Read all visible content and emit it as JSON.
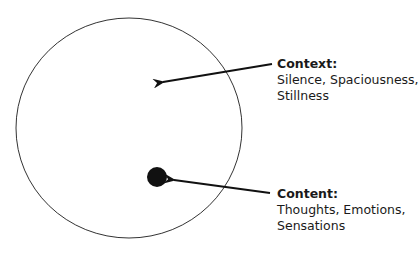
{
  "diagram": {
    "outer_circle": {
      "name": "context-circle"
    },
    "inner_dot": {
      "name": "content-dot"
    },
    "labels": {
      "context": {
        "title": "Context:",
        "line1": "Silence, Spaciousness,",
        "line2": "Stillness"
      },
      "content": {
        "title": "Content:",
        "line1": "Thoughts, Emotions,",
        "line2": "Sensations"
      }
    },
    "colors": {
      "stroke": "#333333",
      "ink": "#111111",
      "text": "#1a1a1a"
    }
  }
}
